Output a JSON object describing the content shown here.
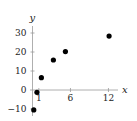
{
  "chart_data": {
    "type": "scatter",
    "title": "",
    "xlabel": "x",
    "ylabel": "y",
    "xlim": [
      0,
      13.5
    ],
    "ylim": [
      -12,
      34
    ],
    "x_ticks": [
      1,
      6,
      12
    ],
    "x_tick_labels": [
      "1",
      "6",
      "12"
    ],
    "y_ticks": [
      -10,
      0,
      10,
      20,
      30
    ],
    "y_tick_labels": [
      "−10",
      "0",
      "10",
      "20",
      "30"
    ],
    "grid": false,
    "legend": "none",
    "series": [
      {
        "name": "points",
        "color": "#000000",
        "points": [
          {
            "x": 0.2,
            "y": -10.5
          },
          {
            "x": 0.7,
            "y": -1.2
          },
          {
            "x": 1.4,
            "y": 6.5
          },
          {
            "x": 3.3,
            "y": 15.8
          },
          {
            "x": 5.2,
            "y": 20.2
          },
          {
            "x": 12.1,
            "y": 28.4
          }
        ]
      }
    ]
  }
}
